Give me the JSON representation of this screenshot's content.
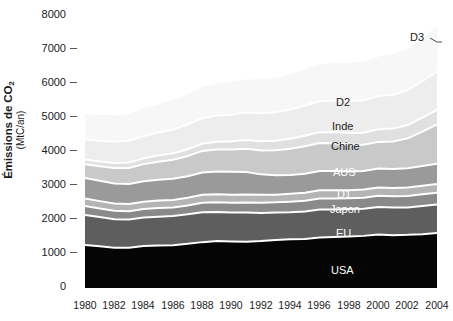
{
  "axes": {
    "ylabel_main": "Émissions de CO",
    "ylabel_sub_script": "2",
    "ylabel_units": "(MtC/an)",
    "yticks": [
      "8000",
      "7000",
      "6000",
      "5000",
      "4000",
      "3000",
      "2000",
      "1000",
      "0"
    ],
    "xticks": [
      "1980",
      "1982",
      "1984",
      "1986",
      "1988",
      "1990",
      "1992",
      "1994",
      "1996",
      "1998",
      "2000",
      "2002",
      "2004"
    ]
  },
  "labels": {
    "d3": "D3",
    "d2": "D2",
    "inde": "Inde",
    "chine": "Chine",
    "aus": "AUS",
    "d1": "D1",
    "japon": "Japon",
    "eu": "EU",
    "usa": "USA"
  },
  "colors": {
    "usa": "#050505",
    "eu": "#5e5e5e",
    "japon": "#8a8a8a",
    "d1": "#b4b4b4",
    "aus": "#9a9a9a",
    "chine": "#c9c9c9",
    "inde": "#e0e0e0",
    "d2": "#ededed",
    "d3": "#f7f7f7",
    "separator": "#ffffff",
    "tick": "#555555",
    "text": "#1a1a1a"
  },
  "chart_data": {
    "type": "area",
    "title": "",
    "xlabel": "",
    "ylabel": "Émissions de CO2 (MtC/an)",
    "xlim": [
      1980,
      2004
    ],
    "ylim": [
      0,
      8000
    ],
    "grid": false,
    "legend": "in-plot labels",
    "stacked": true,
    "x": [
      1980,
      1981,
      1982,
      1983,
      1984,
      1985,
      1986,
      1987,
      1988,
      1989,
      1990,
      1991,
      1992,
      1993,
      1994,
      1995,
      1996,
      1997,
      1998,
      1999,
      2000,
      2001,
      2002,
      2003,
      2004
    ],
    "series": [
      {
        "name": "USA",
        "color": "#050505",
        "values": [
          1240,
          1200,
          1160,
          1160,
          1210,
          1220,
          1230,
          1270,
          1320,
          1350,
          1340,
          1330,
          1350,
          1380,
          1400,
          1410,
          1450,
          1470,
          1480,
          1500,
          1540,
          1520,
          1530,
          1550,
          1580
        ]
      },
      {
        "name": "EU",
        "color": "#5e5e5e",
        "values": [
          860,
          840,
          820,
          810,
          820,
          830,
          840,
          850,
          860,
          840,
          830,
          840,
          810,
          790,
          780,
          790,
          810,
          790,
          790,
          780,
          790,
          800,
          790,
          810,
          820
        ]
      },
      {
        "name": "Japon",
        "color": "#8a8a8a",
        "values": [
          260,
          250,
          245,
          240,
          245,
          250,
          250,
          255,
          275,
          280,
          285,
          290,
          295,
          295,
          305,
          310,
          315,
          315,
          310,
          320,
          325,
          320,
          330,
          335,
          340
        ]
      },
      {
        "name": "D1",
        "color": "#b4b4b4",
        "values": [
          215,
          210,
          205,
          205,
          210,
          215,
          215,
          220,
          230,
          230,
          230,
          230,
          225,
          220,
          225,
          230,
          235,
          235,
          230,
          235,
          240,
          240,
          245,
          250,
          255
        ]
      },
      {
        "name": "AUS",
        "color": "#9a9a9a",
        "values": [
          590,
          585,
          580,
          575,
          585,
          600,
          610,
          620,
          640,
          650,
          660,
          650,
          590,
          560,
          545,
          550,
          560,
          560,
          545,
          535,
          545,
          545,
          550,
          565,
          580
        ]
      },
      {
        "name": "Chine",
        "color": "#c9c9c9",
        "values": [
          400,
          420,
          440,
          465,
          495,
          520,
          545,
          580,
          620,
          635,
          640,
          670,
          690,
          720,
          750,
          790,
          800,
          790,
          770,
          750,
          765,
          790,
          860,
          990,
          1130
        ]
      },
      {
        "name": "Inde",
        "color": "#e0e0e0",
        "values": [
          130,
          138,
          146,
          155,
          165,
          175,
          185,
          198,
          210,
          222,
          235,
          250,
          262,
          272,
          288,
          302,
          315,
          328,
          338,
          350,
          362,
          372,
          385,
          400,
          420
        ]
      },
      {
        "name": "D2",
        "color": "#ededed",
        "values": [
          580,
          595,
          610,
          625,
          645,
          665,
          685,
          710,
          735,
          755,
          775,
          790,
          805,
          820,
          845,
          870,
          890,
          905,
          915,
          930,
          955,
          975,
          1005,
          1050,
          1100
        ]
      },
      {
        "name": "D3",
        "color": "#f7f7f7",
        "values": [
          760,
          775,
          790,
          810,
          830,
          850,
          875,
          900,
          925,
          950,
          970,
          985,
          1000,
          1015,
          1040,
          1065,
          1090,
          1110,
          1125,
          1145,
          1170,
          1195,
          1230,
          1280,
          1345
        ]
      }
    ],
    "stack_totals_note": "Total rises from ~5035 MtC in 1980 to ~7570 MtC in 2004"
  }
}
